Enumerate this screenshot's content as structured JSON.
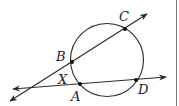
{
  "diagram": {
    "type": "geometry-circle-secants",
    "circle": {
      "cx": 107,
      "cy": 60,
      "r": 36.5
    },
    "lines": [
      {
        "name": "secant-BC",
        "from": [
          10,
          101
        ],
        "to": [
          147,
          14
        ],
        "arrows": "both"
      },
      {
        "name": "secant-AD",
        "from": [
          13,
          89
        ],
        "to": [
          166,
          77
        ],
        "arrows": "both"
      }
    ],
    "points": [
      {
        "name": "C",
        "x": 125,
        "y": 29
      },
      {
        "name": "B",
        "x": 72,
        "y": 62
      },
      {
        "name": "A",
        "x": 80,
        "y": 84
      },
      {
        "name": "D",
        "x": 136,
        "y": 80
      }
    ],
    "labels": {
      "C": "C",
      "B": "B",
      "X": "X",
      "A": "A",
      "D": "D"
    },
    "colors": {
      "line": "#2a2a2a",
      "point": "#111111",
      "background": "#ffffff",
      "border": "#777777"
    }
  }
}
